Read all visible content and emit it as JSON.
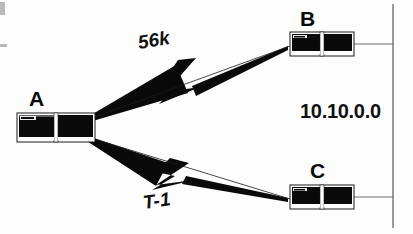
{
  "diagram": {
    "background_color": "#fdfdfd",
    "ink_color": "#0a0a0a",
    "line_color": "#6f6f6f",
    "nodes": [
      {
        "id": "A",
        "label": "A",
        "icon": "router-device-icon",
        "x": 17,
        "y": 113,
        "width": 78,
        "height": 29
      },
      {
        "id": "B",
        "label": "B",
        "icon": "router-device-icon",
        "x": 290,
        "y": 32,
        "width": 64,
        "height": 24
      },
      {
        "id": "C",
        "label": "C",
        "icon": "router-device-icon",
        "x": 290,
        "y": 185,
        "width": 64,
        "height": 24
      }
    ],
    "links": [
      {
        "id": "link-a-b",
        "label": "56k",
        "from": "A",
        "to": "B",
        "style": "wan-lightning",
        "label_rotation_deg": -9
      },
      {
        "id": "link-a-c",
        "label": "T-1",
        "from": "A",
        "to": "C",
        "style": "wan-lightning",
        "label_rotation_deg": -8
      }
    ],
    "backbone": {
      "id": "backbone-segment",
      "label": "10.10.0.0",
      "orientation": "vertical",
      "x": 393,
      "y_top": 4,
      "y_bottom": 228
    },
    "scan_marks": [
      {
        "id": "scan-mark-top"
      },
      {
        "id": "scan-mark-mid"
      }
    ]
  }
}
